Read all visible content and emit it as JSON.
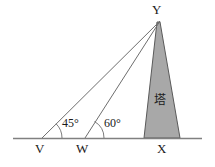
{
  "figure": {
    "colors": {
      "stroke": "#6e6e6e",
      "tower_fill": "#a8a8a8",
      "tower_stroke": "#5a5a5a",
      "ground": "#808080",
      "text": "#1b1b1b",
      "background": "#ffffff"
    },
    "vertices": {
      "apex": {
        "label": "Y",
        "x": 160,
        "y": 20
      },
      "left_point": {
        "label": "V",
        "x": 42,
        "y": 138
      },
      "mid_point": {
        "label": "W",
        "x": 85,
        "y": 138
      },
      "base_point": {
        "label": "X",
        "x": 163,
        "y": 138
      }
    },
    "angles": [
      {
        "label": "45°",
        "at": "V",
        "value": 45
      },
      {
        "label": "60°",
        "at": "W",
        "value": 60
      }
    ],
    "tower": {
      "label": "塔",
      "base_left_x": 144,
      "base_right_x": 180,
      "base_y": 138,
      "apex_x": 160,
      "apex_y": 20
    },
    "ground_line": {
      "x1": 13,
      "x2": 202,
      "y": 138
    }
  }
}
